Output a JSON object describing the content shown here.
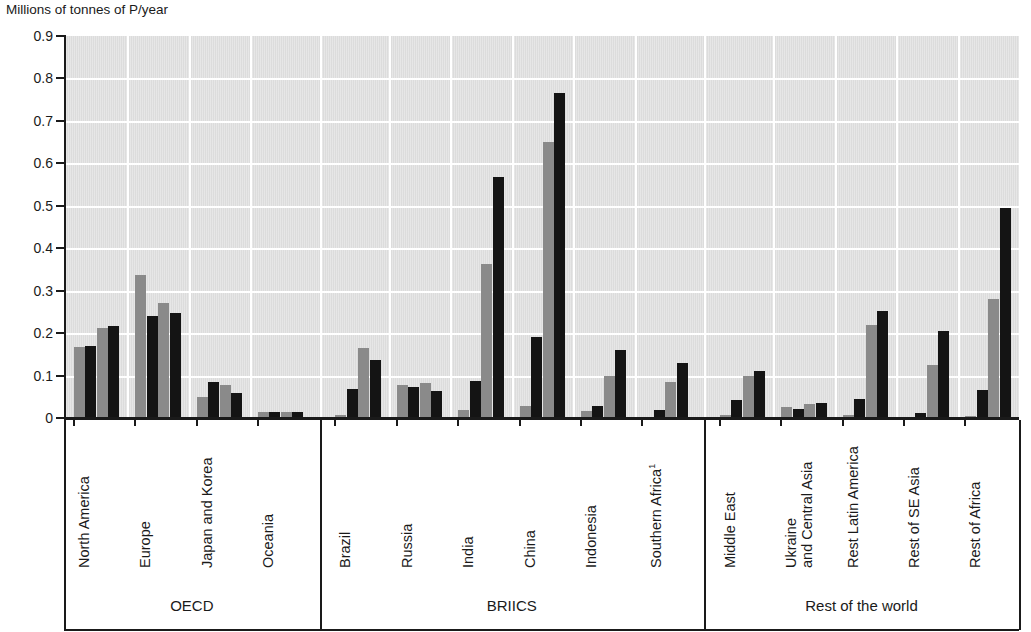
{
  "axis": {
    "y_title": "Millions of tonnes of P/year",
    "y_ticks": [
      "0.9",
      "0.8",
      "0.7",
      "0.6",
      "0.5",
      "0.4",
      "0.3",
      "0.2",
      "0.1",
      "0"
    ]
  },
  "groups": [
    {
      "name": "OECD"
    },
    {
      "name": "BRIICS"
    },
    {
      "name": "Rest of the world"
    }
  ],
  "categories": [
    {
      "label": "North America",
      "line2": "",
      "sup": "",
      "group": "OECD"
    },
    {
      "label": "Europe",
      "line2": "",
      "sup": "",
      "group": "OECD"
    },
    {
      "label": "Japan and Korea",
      "line2": "",
      "sup": "",
      "group": "OECD"
    },
    {
      "label": "Oceania",
      "line2": "",
      "sup": "",
      "group": "OECD"
    },
    {
      "label": "Brazil",
      "line2": "",
      "sup": "",
      "group": "BRIICS"
    },
    {
      "label": "Russia",
      "line2": "",
      "sup": "",
      "group": "BRIICS"
    },
    {
      "label": "India",
      "line2": "",
      "sup": "",
      "group": "BRIICS"
    },
    {
      "label": "China",
      "line2": "",
      "sup": "",
      "group": "BRIICS"
    },
    {
      "label": "Indonesia",
      "line2": "",
      "sup": "",
      "group": "BRIICS"
    },
    {
      "label": "Southern Africa",
      "line2": "",
      "sup": "1",
      "group": "BRIICS"
    },
    {
      "label": "Middle East",
      "line2": "",
      "sup": "",
      "group": "Rest of the world"
    },
    {
      "label": "Ukraine",
      "line2": "and Central Asia",
      "sup": "",
      "group": "Rest of the world"
    },
    {
      "label": "Rest Latin America",
      "line2": "",
      "sup": "",
      "group": "Rest of the world"
    },
    {
      "label": "Rest of SE Asia",
      "line2": "",
      "sup": "",
      "group": "Rest of the world"
    },
    {
      "label": "Rest of Africa",
      "line2": "",
      "sup": "",
      "group": "Rest of the world"
    }
  ],
  "chart_data": {
    "type": "bar",
    "title": "",
    "xlabel": "",
    "ylabel": "Millions of tonnes of P/year",
    "ylim": [
      0,
      0.9
    ],
    "ytick_step": 0.1,
    "grid": true,
    "legend": "none",
    "colors": {
      "series_gray": "#8a8a8a",
      "series_black": "#141414",
      "plot_background": "#dcdcdc"
    },
    "categories": [
      "North America",
      "Europe",
      "Japan and Korea",
      "Oceania",
      "Brazil",
      "Russia",
      "India",
      "China",
      "Indonesia",
      "Southern Africa",
      "Middle East",
      "Ukraine and Central Asia",
      "Rest Latin America",
      "Rest of SE Asia",
      "Rest of Africa"
    ],
    "group_spans": [
      {
        "name": "OECD",
        "categories": [
          "North America",
          "Europe",
          "Japan and Korea",
          "Oceania"
        ]
      },
      {
        "name": "BRIICS",
        "categories": [
          "Brazil",
          "Russia",
          "India",
          "China",
          "Indonesia",
          "Southern Africa"
        ]
      },
      {
        "name": "Rest of the world",
        "categories": [
          "Middle East",
          "Ukraine and Central Asia",
          "Rest Latin America",
          "Rest of SE Asia",
          "Rest of Africa"
        ]
      }
    ],
    "series": [
      {
        "name": "Series 1",
        "color": "#8a8a8a",
        "values": [
          0.168,
          0.336,
          0.05,
          0.013,
          0.008,
          0.078,
          0.018,
          0.028,
          0.016,
          0.003,
          0.008,
          0.025,
          0.006,
          0.002,
          0.004
        ]
      },
      {
        "name": "Series 2",
        "color": "#141414",
        "values": [
          0.17,
          0.24,
          0.085,
          0.013,
          0.068,
          0.073,
          0.087,
          0.19,
          0.028,
          0.02,
          0.043,
          0.022,
          0.045,
          0.012,
          0.066
        ]
      },
      {
        "name": "Series 3",
        "color": "#8a8a8a",
        "values": [
          0.213,
          0.272,
          0.078,
          0.014,
          0.165,
          0.082,
          0.362,
          0.65,
          0.1,
          0.085,
          0.1,
          0.034,
          0.219,
          0.126,
          0.281
        ]
      },
      {
        "name": "Series 4",
        "color": "#141414",
        "values": [
          0.217,
          0.248,
          0.06,
          0.013,
          0.137,
          0.063,
          0.568,
          0.765,
          0.16,
          0.13,
          0.11,
          0.036,
          0.253,
          0.206,
          0.494
        ]
      }
    ]
  },
  "footnote": {
    "marker": "1"
  }
}
